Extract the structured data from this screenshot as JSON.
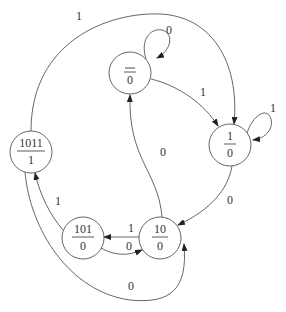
{
  "diagram": {
    "type": "state-machine",
    "states": [
      {
        "id": "s0",
        "name": "",
        "output": "0",
        "overbar": true
      },
      {
        "id": "s1",
        "name": "1",
        "output": "0"
      },
      {
        "id": "s10",
        "name": "10",
        "output": "0"
      },
      {
        "id": "s101",
        "name": "101",
        "output": "0"
      },
      {
        "id": "s1011",
        "name": "1011",
        "output": "1"
      }
    ],
    "transitions": [
      {
        "from": "s0",
        "to": "s0",
        "label": "0"
      },
      {
        "from": "s0",
        "to": "s1",
        "label": "1"
      },
      {
        "from": "s1",
        "to": "s1",
        "label": "1"
      },
      {
        "from": "s1",
        "to": "s10",
        "label": "0"
      },
      {
        "from": "s10",
        "to": "s0",
        "label": "0"
      },
      {
        "from": "s10",
        "to": "s101",
        "label": "1"
      },
      {
        "from": "s101",
        "to": "s10",
        "label": "0"
      },
      {
        "from": "s101",
        "to": "s1011",
        "label": "1"
      },
      {
        "from": "s1011",
        "to": "s1",
        "label": "1"
      },
      {
        "from": "s1011",
        "to": "s10",
        "label": "0"
      }
    ]
  }
}
